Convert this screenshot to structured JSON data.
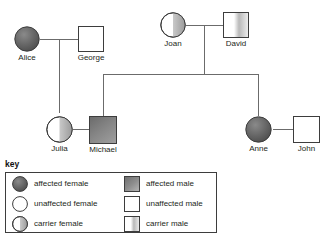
{
  "diagram": {
    "type": "pedigree-chart",
    "line_color": "#6b6b6b",
    "colors": {
      "affected": "#595959",
      "carrier": "#b0b0b0",
      "unaffected": "#ffffff",
      "outline": "#3d3d3d",
      "text": "#231f20"
    },
    "people": [
      {
        "id": "alice",
        "name": "Alice",
        "sex": "female",
        "status": "affected",
        "icon": "affected-female-circle"
      },
      {
        "id": "george",
        "name": "George",
        "sex": "male",
        "status": "unaffected",
        "icon": "unaffected-male-square"
      },
      {
        "id": "joan",
        "name": "Joan",
        "sex": "female",
        "status": "carrier",
        "icon": "carrier-female-circle"
      },
      {
        "id": "david",
        "name": "David",
        "sex": "male",
        "status": "carrier",
        "icon": "carrier-male-square"
      },
      {
        "id": "julia",
        "name": "Julia",
        "sex": "female",
        "status": "carrier",
        "icon": "carrier-female-circle"
      },
      {
        "id": "michael",
        "name": "Michael",
        "sex": "male",
        "status": "affected",
        "icon": "affected-male-square"
      },
      {
        "id": "anne",
        "name": "Anne",
        "sex": "female",
        "status": "affected",
        "icon": "affected-female-circle"
      },
      {
        "id": "john",
        "name": "John",
        "sex": "male",
        "status": "unaffected",
        "icon": "unaffected-male-square"
      }
    ],
    "relationships": [
      {
        "type": "partnership",
        "between": [
          "alice",
          "george"
        ]
      },
      {
        "type": "partnership",
        "between": [
          "joan",
          "david"
        ]
      },
      {
        "type": "partnership",
        "between": [
          "julia",
          "michael"
        ]
      },
      {
        "type": "partnership",
        "between": [
          "anne",
          "john"
        ]
      },
      {
        "type": "descent",
        "parents": [
          "alice",
          "george"
        ],
        "children": [
          "julia"
        ]
      },
      {
        "type": "descent",
        "parents": [
          "joan",
          "david"
        ],
        "children": [
          "michael",
          "anne"
        ]
      }
    ]
  },
  "key": {
    "title": "key",
    "left_column": [
      {
        "icon": "affected-female-circle",
        "label": "affected female"
      },
      {
        "icon": "unaffected-female-circle",
        "label": "unaffected female"
      },
      {
        "icon": "carrier-female-circle",
        "label": "carrier female"
      }
    ],
    "right_column": [
      {
        "icon": "affected-male-square",
        "label": "affected male"
      },
      {
        "icon": "unaffected-male-square",
        "label": "unaffected male"
      },
      {
        "icon": "carrier-male-square",
        "label": "carrier male"
      }
    ]
  }
}
